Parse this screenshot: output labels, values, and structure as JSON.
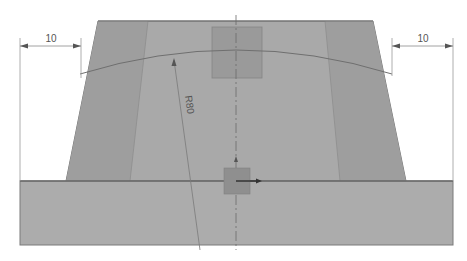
{
  "drawing": {
    "colors": {
      "background": "#ffffff",
      "body_fill": "#a9a9a9",
      "side_band_fill": "#9e9e9e",
      "base_fill": "#acacac",
      "edge": "#7a7a7a",
      "square_fill": "#9a9a9a",
      "origin_square_fill": "#8f8f8f",
      "dim_line": "#8a8a8a",
      "arc": "#6f6f6f",
      "axis": "#6a6a6a"
    },
    "dimensions": {
      "left_width": "10",
      "right_width": "10",
      "radius": "R80"
    },
    "shapes": {
      "trapezoid": "Tapered body",
      "base": "Base plate",
      "top_square": "Sketch point region",
      "origin_square": "Origin marker"
    }
  }
}
